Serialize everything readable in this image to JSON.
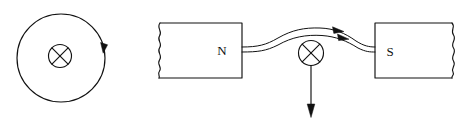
{
  "figure": {
    "stroke_color": "#111111",
    "background_color": "#ffffff"
  },
  "left_panel": {
    "name": "circular-field-line-diagram",
    "field_circle": {
      "center_x": 61,
      "center_y": 58,
      "radius": 44,
      "direction": "clockwise"
    },
    "direction_arrow": {
      "label": "field-direction-arrowhead",
      "x": 104,
      "y": 48,
      "points": "down"
    },
    "conductor": {
      "symbol": "cross-in-circle-icon",
      "meaning": "current into page",
      "center_x": 60,
      "center_y": 56,
      "radius": 12
    }
  },
  "right_panel": {
    "name": "magnet-poles-diagram",
    "north_pole": {
      "label": "N",
      "x": 156,
      "y": 23,
      "width": 86,
      "height": 55,
      "torn_edge": "left"
    },
    "south_pole": {
      "label": "S",
      "x": 375,
      "y": 23,
      "width": 85,
      "height": 55,
      "torn_edge": "right"
    },
    "field_lines": [
      {
        "name": "field-line-upper",
        "start_y": 47,
        "end_y": 47,
        "peak_y": 30,
        "arrow_x": 340,
        "arrow_y": 30
      },
      {
        "name": "field-line-lower",
        "start_y": 52,
        "end_y": 52,
        "peak_y": 37,
        "arrow_x": 345,
        "arrow_y": 37
      }
    ],
    "conductor": {
      "symbol": "cross-in-circle-icon",
      "meaning": "current into page",
      "center_x": 311,
      "center_y": 53,
      "radius": 13
    },
    "force_arrow": {
      "name": "force-arrow",
      "direction": "down",
      "x": 311,
      "start_y": 66,
      "end_y": 117
    }
  }
}
